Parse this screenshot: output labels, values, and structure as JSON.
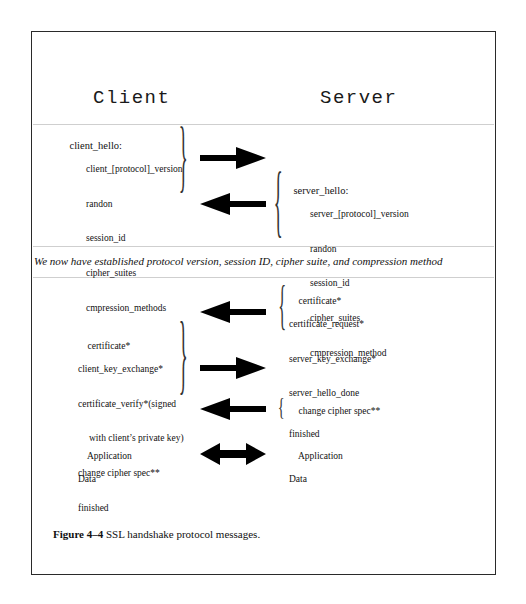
{
  "figure": {
    "caption_label": "Figure 4–4",
    "caption_text": " SSL handshake protocol messages."
  },
  "columns": {
    "client_header": "Client",
    "server_header": "Server"
  },
  "note": "We now have established protocol version, session ID, cipher suite, and compression method",
  "messages": {
    "client_hello": {
      "title": "client_hello:",
      "items": [
        "client_[protocol]_version",
        "randon",
        "session_id",
        "cipher_suites",
        "cmpression_methods"
      ]
    },
    "server_hello": {
      "title": "server_hello:",
      "items": [
        "server_[protocol]_version",
        "randon",
        "session_id",
        "cipher_suites",
        "cmpression_method"
      ]
    },
    "server_certificate_block": {
      "items": [
        "certificate*",
        "certificate_request*",
        "server_key_exchange*",
        "server_hello_done"
      ]
    },
    "client_certificate_block": {
      "items": [
        "certificate*",
        "client_key_exchange*",
        "certificate_verify*(signed",
        "with client’s private key)",
        "change cipher spec**",
        "finished"
      ]
    },
    "server_finish_block": {
      "items": [
        "change cipher spec**",
        "finished"
      ]
    },
    "client_app_data": {
      "items": [
        "Application",
        "Data"
      ]
    },
    "server_app_data": {
      "items": [
        "Application",
        "Data"
      ]
    }
  },
  "arrows": [
    {
      "name": "arrow-client-to-server-hello",
      "direction": "right"
    },
    {
      "name": "arrow-server-to-client-hello",
      "direction": "left"
    },
    {
      "name": "arrow-server-certificate",
      "direction": "left"
    },
    {
      "name": "arrow-client-key-exchange",
      "direction": "right"
    },
    {
      "name": "arrow-server-finished",
      "direction": "left"
    },
    {
      "name": "arrow-application-data",
      "direction": "both"
    }
  ],
  "colors": {
    "ink": "#111111",
    "frame": "#2a2a2a",
    "rule": "#cfcfcf",
    "background": "#ffffff"
  }
}
